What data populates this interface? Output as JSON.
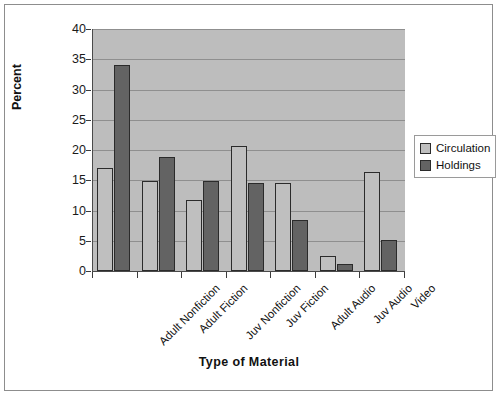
{
  "chart_data": {
    "type": "bar",
    "title": "",
    "xlabel": "Type of Material",
    "ylabel": "Percent",
    "ylim": [
      0,
      40
    ],
    "ytick_step": 5,
    "yticks": [
      "0",
      "5",
      "10",
      "15",
      "20",
      "25",
      "30",
      "35",
      "40"
    ],
    "grid": true,
    "legend_position": "right",
    "categories": [
      "Adult Nonfiction",
      "Adult Fiction",
      "Juv Nonfiction",
      "Juv Fiction",
      "Adult Audio",
      "Juv Audio",
      "Video"
    ],
    "series": [
      {
        "name": "Circulation",
        "color": "#bfbfbf",
        "values": [
          17.0,
          14.8,
          11.7,
          20.7,
          14.6,
          2.5,
          16.4
        ]
      },
      {
        "name": "Holdings",
        "color": "#636363",
        "values": [
          34.0,
          18.9,
          14.8,
          14.6,
          8.4,
          1.2,
          5.2
        ]
      }
    ],
    "plot_background": "#bdbdbd",
    "gridline_color": "#8f8f8f",
    "axis_color": "#4a4a4a"
  },
  "legend": {
    "items": [
      {
        "label": "Circulation",
        "color": "#bfbfbf"
      },
      {
        "label": "Holdings",
        "color": "#636363"
      }
    ]
  }
}
